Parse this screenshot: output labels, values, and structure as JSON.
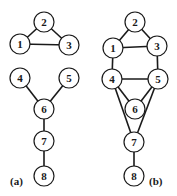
{
  "node_radius": 10,
  "graphs": [
    {
      "id": "a",
      "label": "(a)",
      "label_pos": [
        10,
        185
      ],
      "nodes": [
        {
          "id": "1",
          "label": "1",
          "x": 20,
          "y": 44
        },
        {
          "id": "2",
          "label": "2",
          "x": 44,
          "y": 22
        },
        {
          "id": "3",
          "label": "3",
          "x": 69,
          "y": 45
        },
        {
          "id": "4",
          "label": "4",
          "x": 20,
          "y": 78
        },
        {
          "id": "5",
          "label": "5",
          "x": 69,
          "y": 78
        },
        {
          "id": "6",
          "label": "6",
          "x": 44,
          "y": 109
        },
        {
          "id": "7",
          "label": "7",
          "x": 44,
          "y": 141
        },
        {
          "id": "8",
          "label": "8",
          "x": 44,
          "y": 176
        }
      ],
      "edges": [
        [
          "1",
          "2"
        ],
        [
          "2",
          "3"
        ],
        [
          "1",
          "3"
        ],
        [
          "4",
          "6"
        ],
        [
          "5",
          "6"
        ],
        [
          "6",
          "7"
        ],
        [
          "7",
          "8"
        ]
      ]
    },
    {
      "id": "b",
      "label": "(b)",
      "label_pos": [
        149,
        185
      ],
      "nodes": [
        {
          "id": "1",
          "label": "1",
          "x": 113,
          "y": 48
        },
        {
          "id": "2",
          "label": "2",
          "x": 135,
          "y": 22
        },
        {
          "id": "3",
          "label": "3",
          "x": 157,
          "y": 46
        },
        {
          "id": "4",
          "label": "4",
          "x": 112,
          "y": 79
        },
        {
          "id": "5",
          "label": "5",
          "x": 158,
          "y": 79
        },
        {
          "id": "6",
          "label": "6",
          "x": 135,
          "y": 109
        },
        {
          "id": "7",
          "label": "7",
          "x": 134,
          "y": 142
        },
        {
          "id": "8",
          "label": "8",
          "x": 134,
          "y": 176
        }
      ],
      "edges": [
        [
          "1",
          "2"
        ],
        [
          "2",
          "3"
        ],
        [
          "1",
          "3"
        ],
        [
          "1",
          "4"
        ],
        [
          "3",
          "5"
        ],
        [
          "4",
          "5"
        ],
        [
          "4",
          "6"
        ],
        [
          "5",
          "6"
        ],
        [
          "4",
          "7"
        ],
        [
          "5",
          "7"
        ],
        [
          "7",
          "8"
        ]
      ]
    }
  ]
}
